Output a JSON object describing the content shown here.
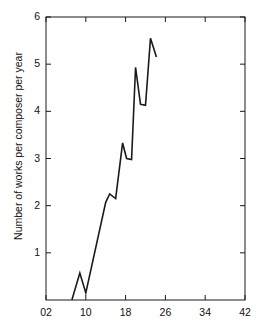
{
  "figure": {
    "background_color": "#ffffff",
    "line_color": "#1a1a1a",
    "axis_color": "#1a1a1a"
  },
  "axis": {
    "y_label": "Number of works per composer per year",
    "x_tick_labels": [
      "02",
      "10",
      "18",
      "26",
      "34",
      "42"
    ],
    "y_tick_labels": [
      "1",
      "2",
      "3",
      "4",
      "5",
      "6"
    ]
  },
  "caption": {
    "text": "partial line of text cropped at bottom edge"
  },
  "chart_data": {
    "type": "line",
    "title": "",
    "xlabel": "",
    "ylabel": "Number of works per composer per year",
    "xlim": [
      2,
      42
    ],
    "ylim": [
      0,
      6
    ],
    "xticks": [
      2,
      10,
      18,
      26,
      34,
      42
    ],
    "yticks": [
      1,
      2,
      3,
      4,
      5,
      6
    ],
    "grid": false,
    "legend": null,
    "series": [
      {
        "name": "works per composer per year",
        "x": [
          7.2,
          8.8,
          10.0,
          14.0,
          14.8,
          16.0,
          17.4,
          18.2,
          19.2,
          20.0,
          21.0,
          22.0,
          23.0,
          24.2
        ],
        "y": [
          0.0,
          0.57,
          0.15,
          2.07,
          2.25,
          2.15,
          3.33,
          3.0,
          2.98,
          4.93,
          4.15,
          4.13,
          5.55,
          5.15
        ]
      }
    ]
  }
}
